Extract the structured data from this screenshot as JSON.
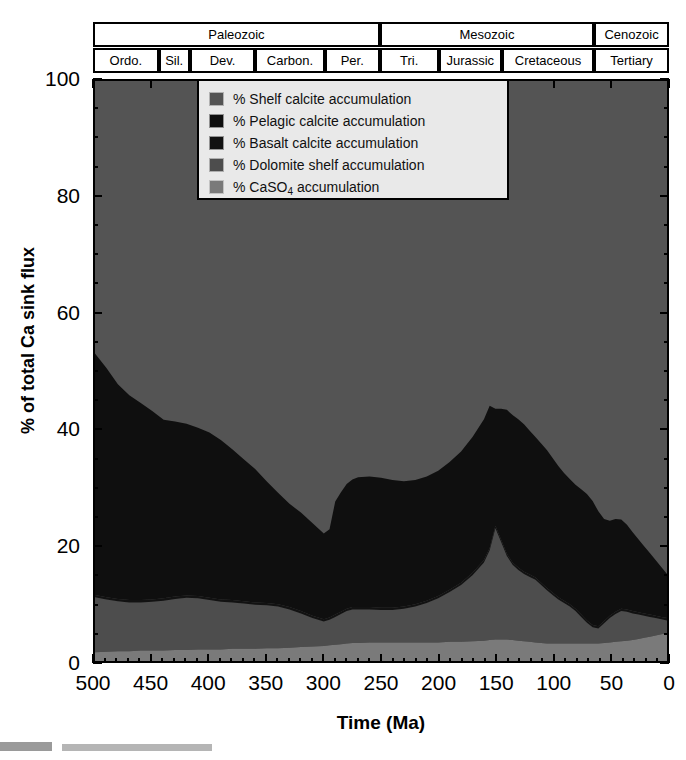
{
  "figure": {
    "axis_titles": {
      "y": "% of total Ca sink flux",
      "x": "Time (Ma)"
    }
  },
  "timescale": {
    "eras": [
      {
        "label": "Paleozoic",
        "start": 500,
        "end": 251
      },
      {
        "label": "Mesozoic",
        "start": 251,
        "end": 65
      },
      {
        "label": "Cenozoic",
        "start": 65,
        "end": 0
      }
    ],
    "periods": [
      {
        "label": "Ordo.",
        "start": 500,
        "end": 443
      },
      {
        "label": "Sil.",
        "start": 443,
        "end": 416
      },
      {
        "label": "Dev.",
        "start": 416,
        "end": 359
      },
      {
        "label": "Carbon.",
        "start": 359,
        "end": 299
      },
      {
        "label": "Per.",
        "start": 299,
        "end": 251
      },
      {
        "label": "Tri.",
        "start": 251,
        "end": 200
      },
      {
        "label": "Jurassic",
        "start": 200,
        "end": 145
      },
      {
        "label": "Cretaceous",
        "start": 145,
        "end": 65
      },
      {
        "label": "Tertiary",
        "start": 65,
        "end": 0
      }
    ]
  },
  "legend": {
    "items": [
      {
        "label": "% Shelf calcite accumulation",
        "color": "#545454"
      },
      {
        "label": "% Pelagic calcite accumulation",
        "color": "#0f0f0f"
      },
      {
        "label": "% Basalt calcite accumulation",
        "color": "#121212"
      },
      {
        "label": "% Dolomite shelf accumulation",
        "color": "#4d4d4d"
      },
      {
        "label": "% CaSO",
        "label_sub": "4",
        "label_tail": " accumulation",
        "color": "#7a7a7a"
      }
    ]
  },
  "chart_data": {
    "type": "area",
    "stacked": true,
    "title": "",
    "xlabel": "Time (Ma)",
    "ylabel": "% of total Ca sink flux",
    "xlim": [
      500,
      0
    ],
    "ylim": [
      0,
      100
    ],
    "x_reversed": true,
    "grid": false,
    "legend_position": "top-center-inside",
    "xticks": [
      500,
      450,
      400,
      350,
      300,
      250,
      200,
      150,
      100,
      50,
      0
    ],
    "xticks_minor_step": 10,
    "yticks": [
      0,
      20,
      40,
      60,
      80,
      100
    ],
    "yticks_minor_step": 5,
    "x": [
      500,
      490,
      480,
      470,
      460,
      450,
      440,
      430,
      420,
      410,
      400,
      390,
      380,
      370,
      360,
      350,
      340,
      330,
      320,
      310,
      300,
      295,
      290,
      285,
      280,
      275,
      270,
      260,
      250,
      240,
      230,
      220,
      210,
      200,
      190,
      180,
      170,
      160,
      155,
      150,
      145,
      140,
      135,
      130,
      125,
      120,
      115,
      110,
      105,
      100,
      95,
      90,
      85,
      80,
      75,
      70,
      65,
      60,
      55,
      50,
      45,
      40,
      35,
      30,
      25,
      20,
      15,
      10,
      5,
      0
    ],
    "series": [
      {
        "name": "% CaSO4 accumulation",
        "color": "#7a7a7a",
        "values": [
          1.5,
          1.6,
          1.7,
          1.7,
          1.8,
          1.8,
          1.8,
          1.9,
          1.9,
          2.0,
          2.0,
          2.0,
          2.1,
          2.1,
          2.1,
          2.2,
          2.2,
          2.3,
          2.4,
          2.5,
          2.6,
          2.7,
          2.8,
          2.9,
          3.0,
          3.1,
          3.1,
          3.2,
          3.2,
          3.2,
          3.2,
          3.2,
          3.2,
          3.2,
          3.3,
          3.3,
          3.4,
          3.5,
          3.6,
          3.7,
          3.7,
          3.7,
          3.6,
          3.5,
          3.4,
          3.3,
          3.2,
          3.1,
          3.0,
          3.0,
          3.0,
          3.0,
          3.0,
          3.0,
          3.0,
          3.0,
          3.0,
          3.0,
          3.1,
          3.2,
          3.3,
          3.4,
          3.5,
          3.6,
          3.8,
          4.0,
          4.2,
          4.4,
          4.6,
          4.8
        ]
      },
      {
        "name": "% Dolomite shelf accumulation",
        "color": "#4d4d4d",
        "values": [
          9.5,
          9.0,
          8.6,
          8.4,
          8.3,
          8.4,
          8.6,
          8.8,
          9.0,
          8.8,
          8.5,
          8.2,
          8.0,
          7.8,
          7.6,
          7.4,
          7.2,
          6.6,
          5.8,
          4.9,
          4.2,
          4.4,
          4.8,
          5.2,
          5.6,
          5.8,
          5.8,
          5.7,
          5.6,
          5.6,
          5.8,
          6.2,
          6.8,
          7.6,
          8.6,
          9.8,
          11.4,
          13.5,
          15.5,
          19.2,
          16.8,
          14.4,
          13.0,
          12.2,
          11.6,
          11.2,
          10.8,
          10.0,
          9.2,
          8.4,
          7.6,
          7.0,
          6.4,
          5.6,
          4.6,
          3.6,
          2.8,
          2.6,
          3.4,
          4.2,
          4.8,
          5.2,
          5.0,
          4.6,
          4.2,
          3.8,
          3.4,
          3.0,
          2.6,
          2.2
        ]
      },
      {
        "name": "% Basalt calcite accumulation",
        "color": "#121212",
        "values": [
          0.4,
          0.4,
          0.4,
          0.4,
          0.4,
          0.4,
          0.4,
          0.4,
          0.4,
          0.4,
          0.4,
          0.4,
          0.4,
          0.4,
          0.4,
          0.4,
          0.4,
          0.4,
          0.4,
          0.4,
          0.4,
          0.4,
          0.4,
          0.4,
          0.4,
          0.4,
          0.4,
          0.4,
          0.4,
          0.4,
          0.4,
          0.4,
          0.4,
          0.4,
          0.4,
          0.4,
          0.4,
          0.4,
          0.4,
          0.4,
          0.4,
          0.4,
          0.4,
          0.4,
          0.4,
          0.4,
          0.4,
          0.4,
          0.4,
          0.4,
          0.4,
          0.4,
          0.4,
          0.4,
          0.4,
          0.4,
          0.4,
          0.4,
          0.4,
          0.4,
          0.4,
          0.4,
          0.4,
          0.4,
          0.4,
          0.4,
          0.4,
          0.4,
          0.4,
          0.4
        ]
      },
      {
        "name": "% Pelagic calcite accumulation",
        "color": "#0f0f0f",
        "values": [
          41.6,
          39.5,
          37.0,
          35.3,
          34.0,
          32.5,
          30.8,
          30.2,
          29.6,
          29.0,
          28.5,
          27.5,
          26.0,
          24.5,
          23.0,
          21.0,
          19.2,
          17.8,
          17.0,
          16.0,
          14.8,
          15.2,
          19.5,
          20.6,
          21.5,
          22.0,
          22.4,
          22.5,
          22.4,
          22.0,
          21.6,
          21.4,
          21.4,
          21.6,
          22.0,
          22.6,
          23.4,
          24.3,
          24.5,
          20.2,
          22.6,
          24.8,
          25.4,
          25.6,
          25.4,
          24.8,
          24.2,
          24.0,
          23.8,
          23.2,
          22.6,
          22.0,
          21.6,
          21.4,
          21.6,
          21.8,
          21.4,
          19.8,
          17.6,
          16.4,
          16.0,
          15.4,
          14.6,
          13.6,
          12.6,
          11.6,
          10.6,
          9.6,
          8.6,
          7.6
        ]
      },
      {
        "name": "% Shelf calcite accumulation",
        "color": "#545454",
        "values": [
          47.0,
          49.5,
          52.3,
          54.2,
          55.5,
          56.9,
          58.4,
          58.7,
          59.1,
          59.8,
          60.6,
          61.9,
          63.5,
          65.2,
          66.9,
          69.0,
          71.0,
          72.9,
          74.4,
          76.2,
          78.0,
          77.3,
          72.5,
          70.9,
          69.5,
          68.7,
          68.3,
          68.2,
          68.4,
          68.8,
          69.0,
          68.8,
          68.2,
          67.2,
          65.7,
          63.9,
          61.4,
          58.3,
          56.0,
          56.5,
          56.5,
          56.7,
          57.6,
          58.3,
          59.2,
          60.3,
          61.4,
          62.5,
          63.6,
          65.0,
          66.4,
          67.6,
          68.6,
          69.6,
          70.4,
          71.2,
          72.4,
          74.2,
          75.5,
          75.8,
          75.5,
          76.0,
          76.5,
          77.8,
          79.0,
          80.2,
          81.4,
          82.6,
          83.8,
          85.0
        ]
      }
    ]
  }
}
